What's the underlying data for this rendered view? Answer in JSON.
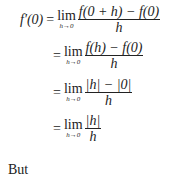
{
  "derivation": {
    "lhs": "f′(0)",
    "steps": [
      {
        "eq": "=",
        "lim": "lim",
        "lim_sub": "h→0",
        "numerator": "f(0 + h) − f(0)",
        "denominator": "h"
      },
      {
        "eq": "=",
        "lim": "lim",
        "lim_sub": "h→0",
        "numerator": "f(h) − f(0)",
        "denominator": "h"
      },
      {
        "eq": "=",
        "lim": "lim",
        "lim_sub": "h→0",
        "numerator": "|h| − |0|",
        "denominator": "h"
      },
      {
        "eq": "=",
        "lim": "lim",
        "lim_sub": "h→0",
        "numerator": "|h|",
        "denominator": "h"
      }
    ]
  },
  "trailing_text": "But"
}
